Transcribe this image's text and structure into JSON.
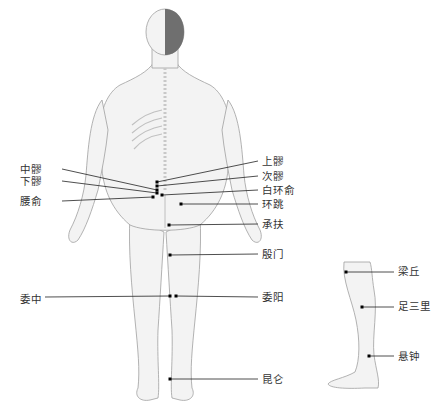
{
  "diagram": {
    "figures": [
      "posterior-body-figure",
      "lateral-leg-figure"
    ],
    "colors": {
      "skin": "#f2f2f2",
      "outline": "#9a9a9a",
      "hair": "#6e6e6e",
      "line": "#222222",
      "point": "#000000",
      "text": "#333333"
    }
  },
  "labels": {
    "left": [
      {
        "id": "zhongliao",
        "text": "中髎",
        "x": 20,
        "y": 163
      },
      {
        "id": "xialiao",
        "text": "下髎",
        "x": 20,
        "y": 175
      },
      {
        "id": "yaoshu",
        "text": "腰俞",
        "x": 20,
        "y": 195
      },
      {
        "id": "weizhong",
        "text": "委中",
        "x": 20,
        "y": 293
      }
    ],
    "right": [
      {
        "id": "shangliao",
        "text": "上髎",
        "x": 262,
        "y": 155
      },
      {
        "id": "ciliao",
        "text": "次髎",
        "x": 262,
        "y": 170
      },
      {
        "id": "baihuanshu",
        "text": "白环俞",
        "x": 262,
        "y": 184
      },
      {
        "id": "huantiao",
        "text": "环跳",
        "x": 262,
        "y": 198
      },
      {
        "id": "chengfu",
        "text": "承扶",
        "x": 262,
        "y": 218
      },
      {
        "id": "yinmen",
        "text": "殷门",
        "x": 262,
        "y": 248
      },
      {
        "id": "weiyang",
        "text": "委阳",
        "x": 262,
        "y": 291
      },
      {
        "id": "kunlun",
        "text": "昆仑",
        "x": 262,
        "y": 373
      }
    ],
    "leg": [
      {
        "id": "liangqiu",
        "text": "梁丘",
        "x": 398,
        "y": 265
      },
      {
        "id": "zusanli",
        "text": "足三里",
        "x": 398,
        "y": 300
      },
      {
        "id": "xuanzhong",
        "text": "悬钟",
        "x": 398,
        "y": 350
      }
    ]
  },
  "points": [
    {
      "id": "shangliao",
      "px": 157,
      "py": 182,
      "lx": 258,
      "ly": 161
    },
    {
      "id": "ciliao",
      "px": 157,
      "py": 186,
      "lx": 258,
      "ly": 176
    },
    {
      "id": "baihuanshu",
      "px": 162,
      "py": 195,
      "lx": 258,
      "ly": 190
    },
    {
      "id": "zhongliao",
      "px": 157,
      "py": 190,
      "lx": 62,
      "ly": 169
    },
    {
      "id": "xialiao",
      "px": 157,
      "py": 193,
      "lx": 62,
      "ly": 181
    },
    {
      "id": "yaoshu",
      "px": 153,
      "py": 197,
      "lx": 62,
      "ly": 201
    },
    {
      "id": "huantiao",
      "px": 181,
      "py": 204,
      "lx": 258,
      "ly": 204
    },
    {
      "id": "chengfu",
      "px": 169,
      "py": 225,
      "lx": 258,
      "ly": 224
    },
    {
      "id": "yinmen",
      "px": 170,
      "py": 255,
      "lx": 258,
      "ly": 254
    },
    {
      "id": "weiyang",
      "px": 176,
      "py": 296,
      "lx": 258,
      "ly": 297
    },
    {
      "id": "weizhong",
      "px": 170,
      "py": 296,
      "lx": 45,
      "ly": 297
    },
    {
      "id": "kunlun",
      "px": 170,
      "py": 379,
      "lx": 258,
      "ly": 379
    },
    {
      "id": "liangqiu",
      "px": 346,
      "py": 272,
      "lx": 394,
      "ly": 272
    },
    {
      "id": "zusanli",
      "px": 362,
      "py": 307,
      "lx": 394,
      "ly": 307
    },
    {
      "id": "xuanzhong",
      "px": 369,
      "py": 356,
      "lx": 394,
      "ly": 356
    }
  ]
}
